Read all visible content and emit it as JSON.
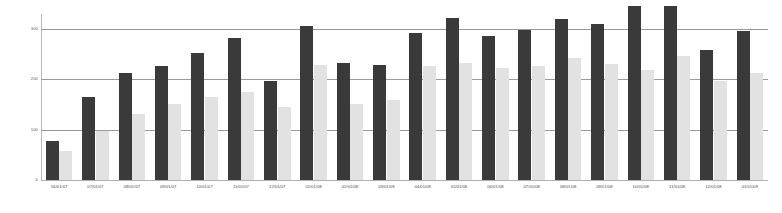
{
  "chart_data": {
    "type": "bar",
    "title": "",
    "subtitle": "",
    "xlabel": "",
    "ylabel": "",
    "ylim": [
      0,
      330
    ],
    "yticks": [
      0,
      100,
      200,
      300
    ],
    "ytick_labels": [
      "0",
      "100",
      "200",
      "300"
    ],
    "grid": true,
    "legend": "none",
    "grouping": "grouped",
    "categories": [
      "06/01/07",
      "07/01/07",
      "08/01/07",
      "09/01/07",
      "10/01/07",
      "11/01/07",
      "12/01/07",
      "01/01/08",
      "02/01/08",
      "03/01/08",
      "04/01/08",
      "05/01/08",
      "06/01/08",
      "07/01/08",
      "08/01/08",
      "09/01/08",
      "10/01/08",
      "11/01/08",
      "12/01/08",
      "01/01/09"
    ],
    "series": [
      {
        "name": "Series 1",
        "color": "#3a3a3a",
        "values": [
          77,
          165,
          213,
          227,
          252,
          282,
          197,
          307,
          232,
          228,
          293,
          322,
          287,
          299,
          321,
          310,
          346,
          345,
          258,
          297
        ]
      },
      {
        "name": "Series 2",
        "color": "#e2e2e2",
        "values": [
          57,
          97,
          132,
          152,
          165,
          175,
          145,
          228,
          152,
          160,
          226,
          232,
          222,
          227,
          243,
          231,
          219,
          247,
          197,
          213
        ]
      }
    ]
  },
  "axis": {
    "y_axis_color": "#b8b8b8",
    "gridline_color": "#9a9a9a",
    "baseline_color": "#b0b0b0",
    "tick_text_color": "#5a5a5a",
    "xlabel_text_color": "#4a4a4a"
  }
}
